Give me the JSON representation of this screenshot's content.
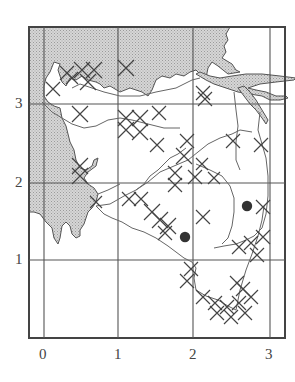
{
  "map": {
    "x_axis_labels": [
      "0",
      "1",
      "2",
      "3"
    ],
    "y_axis_labels": [
      "1",
      "2",
      "3"
    ],
    "land_shading_color": "#c8c8c8",
    "line_color": "#555555",
    "marker_color": "#333333",
    "grid": {
      "frame": {
        "left": 29,
        "top": 27,
        "right": 285,
        "bottom": 338
      },
      "vertical_lines_x": [
        44,
        118,
        193,
        270
      ],
      "horizontal_lines_y": [
        104,
        183,
        260
      ]
    },
    "markers": [
      {
        "name": "site-a",
        "x": 185,
        "y": 237
      },
      {
        "name": "site-b",
        "x": 247,
        "y": 206
      }
    ]
  }
}
